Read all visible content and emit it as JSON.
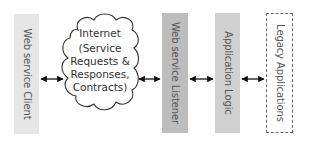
{
  "diagram": {
    "components": [
      {
        "id": "client",
        "label": "Web service Client",
        "fill": "#e6e6e6",
        "border": "none"
      },
      {
        "id": "internet",
        "label": "Internet",
        "shape": "cloud",
        "detail_lines": [
          "(Service",
          "Requests &",
          "Responses,",
          "Contracts)"
        ]
      },
      {
        "id": "listener",
        "label": "Web service Listener",
        "fill": "#bdbdbd",
        "border": "none"
      },
      {
        "id": "logic",
        "label": "Application Logic",
        "fill": "#d0d0d0",
        "border": "none"
      },
      {
        "id": "legacy",
        "label": "Legacy Applications",
        "fill": "#ffffff",
        "border": "dashed"
      }
    ],
    "connections": [
      {
        "from": "client",
        "to": "internet",
        "type": "bidirectional-arrow"
      },
      {
        "from": "internet",
        "to": "listener",
        "type": "bidirectional-arrow"
      },
      {
        "from": "listener",
        "to": "logic",
        "type": "bidirectional-arrow"
      },
      {
        "from": "logic",
        "to": "legacy",
        "type": "bidirectional-arrow"
      }
    ]
  }
}
